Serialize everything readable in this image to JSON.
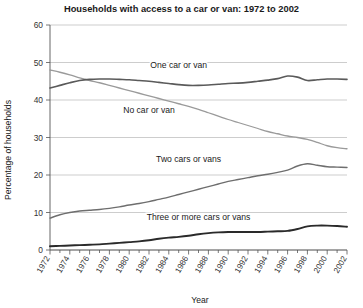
{
  "chart_data": {
    "type": "line",
    "title": "Households with access to a car or van: 1972 to 2002",
    "xlabel": "Year",
    "ylabel": "Percentage of households",
    "ylim": [
      0,
      60
    ],
    "yticks": [
      0,
      10,
      20,
      30,
      40,
      50,
      60
    ],
    "xlim": [
      1972,
      2002
    ],
    "xticks": [
      1972,
      1974,
      1976,
      1978,
      1980,
      1982,
      1984,
      1986,
      1988,
      1990,
      1992,
      1994,
      1996,
      1998,
      2000,
      2002
    ],
    "xtick_labels": [
      "1972",
      "1974",
      "1976",
      "1978",
      "1980",
      "1982",
      "1984",
      "1986",
      "1988",
      "1990",
      "1992",
      "1994",
      "1996",
      "1998",
      "2000",
      "2002"
    ],
    "ytick_labels": [
      "0",
      "10",
      "20",
      "30",
      "40",
      "50",
      "60"
    ],
    "grid": true,
    "grid_axis": "y",
    "legend_position": "inline-annotations",
    "x": [
      1972,
      1973,
      1974,
      1975,
      1976,
      1977,
      1978,
      1979,
      1980,
      1981,
      1982,
      1983,
      1984,
      1985,
      1986,
      1987,
      1988,
      1989,
      1990,
      1991,
      1992,
      1993,
      1994,
      1995,
      1996,
      1997,
      1998,
      1999,
      2000,
      2001,
      2002
    ],
    "series": [
      {
        "name": "No car or van",
        "color": "#9a9a9a",
        "width": 1.3,
        "label": "No car or van",
        "label_x": 1982,
        "label_y": 36.5,
        "values": [
          48.0,
          47.4,
          46.7,
          45.9,
          45.2,
          44.6,
          43.9,
          43.2,
          42.5,
          41.8,
          41.1,
          40.4,
          39.7,
          39.0,
          38.3,
          37.5,
          36.6,
          35.7,
          34.8,
          34.0,
          33.2,
          32.4,
          31.6,
          31.0,
          30.4,
          30.0,
          29.5,
          28.7,
          27.8,
          27.3,
          27.0
        ]
      },
      {
        "name": "One car or van",
        "color": "#5a5a5a",
        "width": 1.6,
        "label": "One car or van",
        "label_x": 1985,
        "label_y": 48.5,
        "values": [
          43.2,
          43.9,
          44.6,
          45.2,
          45.5,
          45.6,
          45.6,
          45.5,
          45.4,
          45.2,
          45.0,
          44.7,
          44.4,
          44.1,
          43.9,
          43.9,
          44.0,
          44.2,
          44.4,
          44.5,
          44.7,
          45.0,
          45.3,
          45.7,
          46.4,
          46.1,
          45.2,
          45.4,
          45.6,
          45.6,
          45.5
        ]
      },
      {
        "name": "Two cars or vans",
        "color": "#6e6e6e",
        "width": 1.4,
        "label": "Two cars or vans",
        "label_x": 1986,
        "label_y": 23.5,
        "values": [
          8.5,
          9.4,
          10.0,
          10.4,
          10.6,
          10.8,
          11.1,
          11.5,
          12.0,
          12.4,
          12.9,
          13.5,
          14.1,
          14.8,
          15.5,
          16.2,
          16.9,
          17.6,
          18.3,
          18.8,
          19.3,
          19.8,
          20.2,
          20.7,
          21.3,
          22.4,
          23.0,
          22.6,
          22.2,
          22.1,
          22.0
        ]
      },
      {
        "name": "Three or more cars or vans",
        "color": "#2a2a2a",
        "width": 1.9,
        "label": "Three or more cars or vans",
        "label_x": 1987,
        "label_y": 8.0,
        "values": [
          1.0,
          1.1,
          1.2,
          1.3,
          1.4,
          1.5,
          1.7,
          1.9,
          2.1,
          2.3,
          2.6,
          3.0,
          3.3,
          3.5,
          3.8,
          4.2,
          4.5,
          4.7,
          4.8,
          4.8,
          4.8,
          4.8,
          4.9,
          5.0,
          5.1,
          5.6,
          6.3,
          6.5,
          6.5,
          6.4,
          6.2
        ]
      }
    ]
  }
}
